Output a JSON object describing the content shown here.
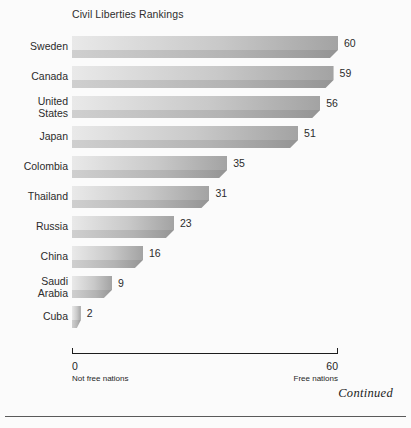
{
  "chart_data": {
    "type": "bar",
    "orientation": "horizontal",
    "title": "Civil Liberties Rankings",
    "xlabel": "",
    "ylabel": "",
    "xlim": [
      0,
      60
    ],
    "grid": false,
    "legend": false,
    "categories": [
      "Sweden",
      "Canada",
      "United States",
      "Japan",
      "Colombia",
      "Thailand",
      "Russia",
      "China",
      "Saudi Arabia",
      "Cuba"
    ],
    "values": [
      60,
      59,
      56,
      51,
      35,
      31,
      23,
      16,
      9,
      2
    ],
    "tick_labels": [
      "0",
      "60"
    ],
    "annotations": [
      "Not free nations",
      "Free nations",
      "Continued"
    ]
  },
  "figure": {
    "title": "Civil Liberties Rankings",
    "continued_note": "Continued",
    "background_color": "#fbfbfb",
    "bar_color_light": "#e9e9e9",
    "bar_color_dark": "#949494"
  },
  "axis": {
    "left": {
      "value": "0",
      "caption": "Not free nations"
    },
    "right": {
      "value": "60",
      "caption": "Free nations"
    }
  },
  "bars": [
    {
      "label_lines": [
        "Sweden"
      ],
      "value": 60,
      "value_label": "60"
    },
    {
      "label_lines": [
        "Canada"
      ],
      "value": 59,
      "value_label": "59"
    },
    {
      "label_lines": [
        "United",
        "States"
      ],
      "value": 56,
      "value_label": "56"
    },
    {
      "label_lines": [
        "Japan"
      ],
      "value": 51,
      "value_label": "51"
    },
    {
      "label_lines": [
        "Colombia"
      ],
      "value": 35,
      "value_label": "35"
    },
    {
      "label_lines": [
        "Thailand"
      ],
      "value": 31,
      "value_label": "31"
    },
    {
      "label_lines": [
        "Russia"
      ],
      "value": 23,
      "value_label": "23"
    },
    {
      "label_lines": [
        "China"
      ],
      "value": 16,
      "value_label": "16"
    },
    {
      "label_lines": [
        "Saudi",
        "Arabia"
      ],
      "value": 9,
      "value_label": "9"
    },
    {
      "label_lines": [
        "Cuba"
      ],
      "value": 2,
      "value_label": "2"
    }
  ]
}
